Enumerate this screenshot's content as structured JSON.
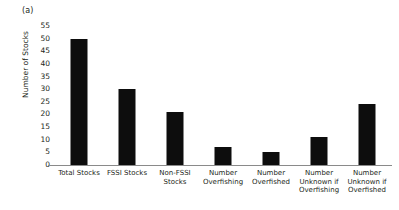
{
  "figure": {
    "panel_label": "(a)"
  },
  "chart_data": {
    "type": "bar",
    "title": "",
    "subtitle": "",
    "xlabel": "",
    "ylabel": "Number of Stocks",
    "ylim": [
      0,
      55
    ],
    "ytick_step": 5,
    "yticks": [
      0,
      5,
      10,
      15,
      20,
      25,
      30,
      35,
      40,
      45,
      50,
      55
    ],
    "ytick_labels": [
      "0",
      "5",
      "10",
      "15",
      "20",
      "25",
      "30",
      "35",
      "40",
      "45",
      "50",
      "55"
    ],
    "grid": false,
    "legend": null,
    "bar_color": "#0d0d0d",
    "axis_color": "#8a8a8a",
    "categories": [
      "Total Stocks",
      "FSSI Stocks",
      "Non-FSSI Stocks",
      "Number Overfishing",
      "Number Overfished",
      "Number Unknown if Overfishing",
      "Number Unknown if Overfished"
    ],
    "category_label_lines": [
      [
        "Total Stocks"
      ],
      [
        "FSSI Stocks"
      ],
      [
        "Non-FSSI",
        "Stocks"
      ],
      [
        "Number",
        "Overfishing"
      ],
      [
        "Number",
        "Overfished"
      ],
      [
        "Number",
        "Unknown if",
        "Overfishing"
      ],
      [
        "Number",
        "Unknown if",
        "Overfished"
      ]
    ],
    "values": [
      50,
      30,
      21,
      7,
      5,
      11,
      24
    ]
  }
}
